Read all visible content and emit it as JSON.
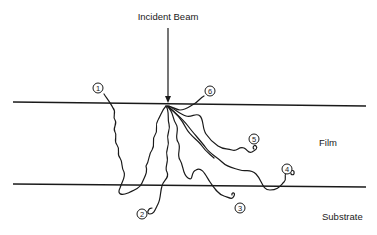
{
  "diagram": {
    "title_label": "Incident Beam",
    "regions": {
      "film": "Film",
      "substrate": "Substrate"
    },
    "trajectories": [
      {
        "id": 1,
        "label": "1"
      },
      {
        "id": 2,
        "label": "2"
      },
      {
        "id": 3,
        "label": "3"
      },
      {
        "id": 4,
        "label": "4"
      },
      {
        "id": 5,
        "label": "5"
      },
      {
        "id": 6,
        "label": "6"
      }
    ],
    "colors": {
      "ink": "#1a1a1a",
      "background": "#ffffff"
    }
  }
}
